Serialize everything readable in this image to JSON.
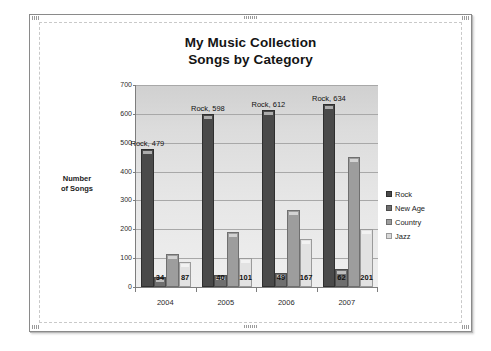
{
  "document": {
    "frame_label": "document-page"
  },
  "chart": {
    "title_line1": "My Music Collection",
    "title_line2": "Songs by Category",
    "axis_title_y_line1": "Number",
    "axis_title_y_line2": "of Songs",
    "y_ticks": [
      "0",
      "100",
      "200",
      "300",
      "400",
      "500",
      "600",
      "700"
    ],
    "x_ticks": [
      "2004",
      "2005",
      "2006",
      "2007"
    ],
    "legend": [
      {
        "label": "Rock",
        "key": "rock",
        "color": "#4a4a4a"
      },
      {
        "label": "New Age",
        "key": "newage",
        "color": "#6f6f6f"
      },
      {
        "label": "Country",
        "key": "country",
        "color": "#9d9d9d"
      },
      {
        "label": "Jazz",
        "key": "jazz",
        "color": "#d8d8d8"
      }
    ],
    "point_labels": {
      "rock_2004": "Rock, 479",
      "rock_2005": "Rock, 598",
      "rock_2006": "Rock, 612",
      "rock_2007": "Rock, 634",
      "newage_2004": "34",
      "newage_2005": "40",
      "newage_2006": "49",
      "newage_2007": "62",
      "jazz_2004": "87",
      "jazz_2005": "101",
      "jazz_2006": "167",
      "jazz_2007": "201"
    }
  },
  "chart_data": {
    "type": "bar",
    "title": "My Music Collection Songs by Category",
    "xlabel": "",
    "ylabel": "Number of Songs",
    "ylim": [
      0,
      700
    ],
    "ytick_step": 100,
    "grid": true,
    "legend_position": "right",
    "categories": [
      "2004",
      "2005",
      "2006",
      "2007"
    ],
    "series": [
      {
        "name": "Rock",
        "values": [
          479,
          598,
          612,
          634
        ],
        "color": "#4a4a4a"
      },
      {
        "name": "New Age",
        "values": [
          34,
          40,
          49,
          62
        ],
        "color": "#6f6f6f"
      },
      {
        "name": "Country",
        "values": [
          113,
          190,
          267,
          449
        ],
        "color": "#9d9d9d"
      },
      {
        "name": "Jazz",
        "values": [
          87,
          101,
          167,
          201
        ],
        "color": "#e2e2e2"
      }
    ],
    "data_labels": {
      "Rock": [
        "Rock, 479",
        "Rock, 598",
        "Rock, 612",
        "Rock, 634"
      ],
      "New Age": [
        "34",
        "40",
        "49",
        "62"
      ],
      "Country": [
        "",
        "",
        "",
        ""
      ],
      "Jazz": [
        "87",
        "101",
        "167",
        "201"
      ]
    }
  }
}
